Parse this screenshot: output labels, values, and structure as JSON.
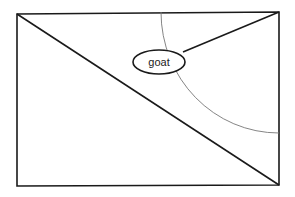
{
  "diagram": {
    "ellipse_label": "goat",
    "colors": {
      "stroke": "#1a1a1a",
      "arc": "#777777",
      "background": "#ffffff"
    }
  }
}
